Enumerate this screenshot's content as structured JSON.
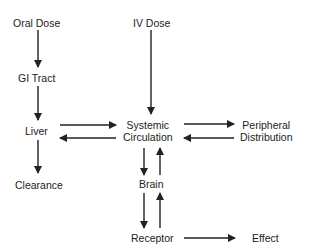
{
  "diagram": {
    "nodes": {
      "oral_dose": "Oral Dose",
      "iv_dose": "IV Dose",
      "gi_tract": "GI Tract",
      "liver": "Liver",
      "systemic_1": "Systemic",
      "systemic_2": "Circulation",
      "peripheral_1": "Peripheral",
      "peripheral_2": "Distribution",
      "clearance": "Clearance",
      "brain": "Brain",
      "receptor": "Receptor",
      "effect": "Effect"
    },
    "edges": [
      {
        "from": "Oral Dose",
        "to": "GI Tract"
      },
      {
        "from": "GI Tract",
        "to": "Liver"
      },
      {
        "from": "Liver",
        "to": "Systemic Circulation"
      },
      {
        "from": "Systemic Circulation",
        "to": "Liver"
      },
      {
        "from": "Liver",
        "to": "Clearance"
      },
      {
        "from": "IV Dose",
        "to": "Systemic Circulation"
      },
      {
        "from": "Systemic Circulation",
        "to": "Peripheral Distribution"
      },
      {
        "from": "Peripheral Distribution",
        "to": "Systemic Circulation"
      },
      {
        "from": "Systemic Circulation",
        "to": "Brain"
      },
      {
        "from": "Brain",
        "to": "Systemic Circulation"
      },
      {
        "from": "Brain",
        "to": "Receptor"
      },
      {
        "from": "Receptor",
        "to": "Brain"
      },
      {
        "from": "Receptor",
        "to": "Effect"
      }
    ]
  }
}
